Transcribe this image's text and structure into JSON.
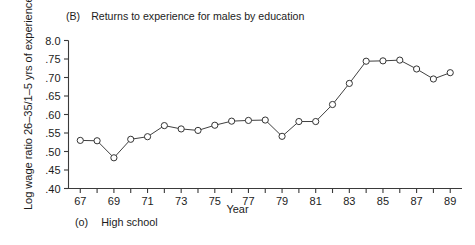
{
  "figure": {
    "panel_tag": "(B)",
    "panel_title": "Returns to experience for males by education",
    "ylabel": "Log wage ratio 26–35/1–5 yrs of experience",
    "xlabel": "Year",
    "legend_marker": "(o)",
    "legend_label": "High school"
  },
  "chart_data": {
    "type": "line",
    "xlabel": "Year",
    "ylabel": "Log wage ratio 26–35/1–5 yrs of experience",
    "grid": false,
    "legend_position": "below-axis-left",
    "xlim": [
      66.3,
      89.7
    ],
    "ylim": [
      0.4,
      0.8
    ],
    "ytick_labels": [
      "8.0",
      ".75",
      ".70",
      ".65",
      ".60",
      ".55",
      ".50",
      ".45",
      ".40"
    ],
    "ytick_values": [
      0.8,
      0.75,
      0.7,
      0.65,
      0.6,
      0.55,
      0.5,
      0.45,
      0.4
    ],
    "xtick_labels": [
      "67",
      "",
      "69",
      "",
      "71",
      "",
      "73",
      "",
      "75",
      "",
      "77",
      "",
      "79",
      "",
      "81",
      "",
      "83",
      "",
      "85",
      "",
      "87",
      "",
      "89"
    ],
    "x": [
      67,
      68,
      69,
      70,
      71,
      72,
      73,
      74,
      75,
      76,
      77,
      78,
      79,
      80,
      81,
      82,
      83,
      84,
      85,
      86,
      87,
      88,
      89
    ],
    "series": [
      {
        "name": "High school",
        "marker": "open-circle",
        "values": [
          0.53,
          0.529,
          0.483,
          0.533,
          0.54,
          0.57,
          0.561,
          0.557,
          0.571,
          0.582,
          0.584,
          0.585,
          0.541,
          0.581,
          0.581,
          0.627,
          0.684,
          0.744,
          0.745,
          0.747,
          0.723,
          0.696,
          0.713
        ]
      }
    ],
    "marker_color": "#ffffff",
    "line_color": "#404040",
    "axis_color": "#3a3a3a"
  }
}
